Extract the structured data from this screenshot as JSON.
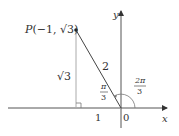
{
  "diagram": {
    "point_label": "P(−1, √3)",
    "point_name": "P",
    "point_coords": "(−1, √3)",
    "axis_x_label": "x",
    "axis_y_label": "y",
    "origin_label": "0",
    "side_vertical_label": "√3",
    "hypotenuse_label": "2",
    "base_label": "1",
    "angle_small": {
      "num": "π",
      "den": "3"
    },
    "angle_large": {
      "num": "2π",
      "den": "3"
    },
    "colors": {
      "axis": "#333333",
      "segment": "#444444",
      "altitude": "#aaaaaa",
      "text": "#333333"
    }
  }
}
